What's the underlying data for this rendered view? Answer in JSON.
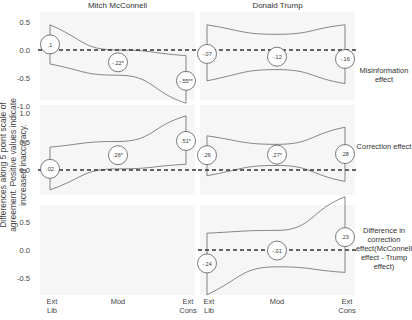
{
  "chart_data": {
    "type": "line",
    "subtype": "faceted point estimates with confidence bands",
    "ylabel": "Differences along 5 point scale of agreement. Positive values indicate increased inaccuracy.",
    "xlabel": "",
    "categories": [
      "Ext Lib",
      "Mod",
      "Ext Cons"
    ],
    "category_labels": [
      [
        "Ext",
        "Lib"
      ],
      [
        "Mod"
      ],
      [
        "Ext",
        "Cons"
      ]
    ],
    "columns": [
      "Mitch McConnell",
      "Donald Trump"
    ],
    "rows": [
      {
        "name": "Misinformation effect",
        "label_lines": [
          "Misinformation",
          "effect"
        ],
        "yticks": [
          "0.5",
          "0.0",
          "-0.5",
          "-1.0"
        ],
        "ylim": [
          -1.0,
          0.5
        ],
        "panels": [
          {
            "column": "Mitch McConnell",
            "values": [
              0.1,
              -0.22,
              -0.55
            ],
            "labels": [
              ".1",
              "-.22*",
              "-.55**"
            ],
            "upper": [
              0.45,
              0.0,
              -0.1
            ],
            "lower": [
              -0.25,
              -0.45,
              -0.95
            ]
          },
          {
            "column": "Donald Trump",
            "values": [
              -0.07,
              -0.12,
              -0.16
            ],
            "labels": [
              "-.07",
              "-.12",
              "-.16"
            ],
            "upper": [
              0.45,
              0.28,
              0.45
            ],
            "lower": [
              -0.55,
              -0.35,
              -0.6
            ]
          }
        ]
      },
      {
        "name": "Correction effect",
        "label_lines": [
          "Correction effect"
        ],
        "yticks": [
          "1.0",
          "0.5",
          "0.0"
        ],
        "ylim": [
          -0.3,
          1.1
        ],
        "panels": [
          {
            "column": "Mitch McConnell",
            "values": [
              0.02,
              0.26,
              0.51
            ],
            "labels": [
              ".02",
              ".26*",
              ".51*"
            ],
            "upper": [
              0.4,
              0.5,
              0.95
            ],
            "lower": [
              -0.35,
              0.02,
              0.1
            ]
          },
          {
            "column": "Donald Trump",
            "values": [
              0.26,
              0.27,
              0.28
            ],
            "labels": [
              ".26",
              ".27*",
              ".28"
            ],
            "upper": [
              0.6,
              0.45,
              0.75
            ],
            "lower": [
              -0.1,
              0.08,
              -0.2
            ]
          }
        ]
      },
      {
        "name": "Difference in correction effect (McConnell effect - Trump effect)",
        "label_lines": [
          "Difference in",
          "correction",
          "effect(McConnell",
          "effect - Trump",
          "effect)"
        ],
        "yticks": [
          "0.5",
          "0.0",
          "-0.5"
        ],
        "ylim": [
          -0.8,
          0.8
        ],
        "panels": [
          {
            "column": "Mitch McConnell",
            "values": [],
            "labels": [],
            "upper": [],
            "lower": []
          },
          {
            "column": "Donald Trump",
            "values": [
              -0.24,
              -0.01,
              0.23
            ],
            "labels": [
              "-.24",
              "-.01",
              ".23"
            ],
            "upper": [
              0.3,
              0.35,
              0.95
            ],
            "lower": [
              -0.8,
              -0.3,
              -0.4
            ]
          }
        ]
      }
    ],
    "reference_line": 0,
    "grid": false,
    "legend": "none"
  },
  "colors": {
    "panel_bg": "#f6f6f6",
    "band_stroke": "#555555",
    "zero_line": "#333333",
    "circle_fill": "#ffffff",
    "text": "#333333"
  }
}
